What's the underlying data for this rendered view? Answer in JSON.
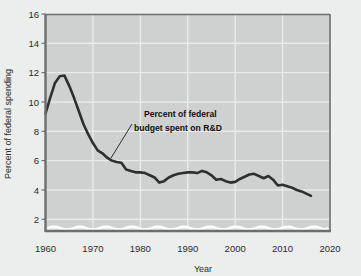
{
  "chart_data": {
    "type": "line",
    "title": "",
    "xlabel": "Year",
    "ylabel": "Percent of federal spending",
    "xlim": [
      1960,
      2020
    ],
    "ylim": [
      1.2,
      16
    ],
    "xticks": [
      1960,
      1970,
      1980,
      1990,
      2000,
      2010,
      2020
    ],
    "xtick_labels": [
      "1960",
      "1970",
      "1980",
      "1990",
      "2000",
      "2010",
      "2020"
    ],
    "yticks": [
      2,
      4,
      6,
      8,
      10,
      12,
      14,
      16
    ],
    "ytick_labels": [
      "2",
      "4",
      "6",
      "8",
      "10",
      "12",
      "14",
      "16"
    ],
    "grid": true,
    "axis_break": true,
    "legend_position": "none",
    "annotations": [
      {
        "name": "series-callout",
        "line1": "Percent of federal",
        "line2": "budget spent on R&D",
        "text": "Percent of federal budget spent on R&D"
      }
    ],
    "series": [
      {
        "name": "Percent of federal budget spent on R&D",
        "color": "#2f2f2f",
        "x": [
          1960,
          1961,
          1962,
          1963,
          1964,
          1965,
          1966,
          1967,
          1968,
          1969,
          1970,
          1971,
          1972,
          1973,
          1974,
          1975,
          1976,
          1977,
          1978,
          1979,
          1980,
          1981,
          1982,
          1983,
          1984,
          1985,
          1986,
          1987,
          1988,
          1989,
          1990,
          1991,
          1992,
          1993,
          1994,
          1995,
          1996,
          1997,
          1998,
          1999,
          2000,
          2001,
          2002,
          2003,
          2004,
          2005,
          2006,
          2007,
          2008,
          2009,
          2010,
          2011,
          2012,
          2013,
          2014,
          2015,
          2016
        ],
        "values": [
          9.2,
          10.3,
          11.3,
          11.75,
          11.8,
          11.1,
          10.3,
          9.4,
          8.5,
          7.8,
          7.2,
          6.7,
          6.5,
          6.2,
          6.0,
          5.9,
          5.85,
          5.4,
          5.3,
          5.2,
          5.2,
          5.15,
          5.0,
          4.85,
          4.5,
          4.6,
          4.85,
          5.0,
          5.1,
          5.15,
          5.2,
          5.2,
          5.15,
          5.3,
          5.2,
          5.0,
          4.7,
          4.75,
          4.6,
          4.5,
          4.55,
          4.75,
          4.9,
          5.05,
          5.1,
          4.95,
          4.8,
          4.95,
          4.7,
          4.3,
          4.35,
          4.25,
          4.15,
          4.0,
          3.9,
          3.75,
          3.6
        ]
      }
    ]
  },
  "colors": {
    "background": "#eceded",
    "plot_background": "#cfd0d0",
    "grid": "#e9eaea",
    "line": "#2f2f2f",
    "axis": "#6e6e6e",
    "text": "#2b2b2b",
    "break_wave": "#ffffff"
  }
}
